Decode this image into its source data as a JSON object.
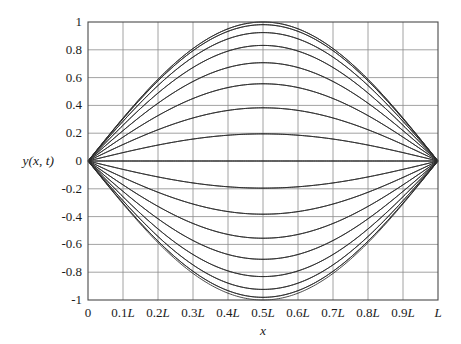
{
  "figure": {
    "background": "#ffffff",
    "frame_color": "#4a4a4a",
    "grid_color": "#8a8a8a",
    "curve_color": "#2b2b2b"
  },
  "chart_data": {
    "type": "line",
    "title": "",
    "subtitle": "",
    "xlabel": "x",
    "ylabel": "y(x, t)",
    "grid": true,
    "legend": "none",
    "xlim": [
      0,
      1
    ],
    "ylim": [
      -1,
      1
    ],
    "xticks": [
      0,
      0.1,
      0.2,
      0.3,
      0.4,
      0.5,
      0.6,
      0.7,
      0.8,
      0.9,
      1
    ],
    "xticklabels": [
      "0",
      "0.1L",
      "0.2L",
      "0.3L",
      "0.4L",
      "0.5L",
      "0.6L",
      "0.7L",
      "0.8L",
      "0.9L",
      "L"
    ],
    "yticks": [
      1,
      0.8,
      0.6,
      0.4,
      0.2,
      0,
      -0.2,
      -0.4,
      -0.6,
      -0.8,
      -1
    ],
    "yticklabels": [
      "1",
      "0.8",
      "0.6",
      "0.4",
      "0.2",
      "0",
      "-0.2",
      "-0.4",
      "-0.6",
      "-0.8",
      "-1"
    ],
    "shape": "sine_half_wave",
    "n_curves": 33,
    "amplitudes": [
      1.0,
      0.98079,
      0.92388,
      0.83147,
      0.70711,
      0.55557,
      0.38268,
      0.19509,
      0.0,
      -0.19509,
      -0.38268,
      -0.55557,
      -0.70711,
      -0.83147,
      -0.92388,
      -0.98079,
      -1.0,
      -0.98079,
      -0.92388,
      -0.83147,
      -0.70711,
      -0.55557,
      -0.38268,
      -0.19509,
      0.0,
      0.19509,
      0.38268,
      0.55557,
      0.70711,
      0.83147,
      0.92388,
      0.98079,
      1.0
    ],
    "series": [
      {
        "name": "y(x,t) snapshots",
        "formula": "A_k * sin(pi*x/L)",
        "values": "generated from amplitudes"
      }
    ]
  },
  "plot_box": {
    "left": 88,
    "top": 22,
    "width": 350,
    "height": 278
  }
}
